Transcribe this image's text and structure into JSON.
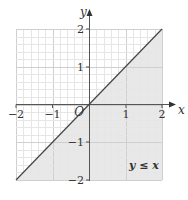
{
  "chart_data": {
    "type": "line",
    "title": "",
    "xlabel": "x",
    "ylabel": "y",
    "xlim": [
      -2,
      2
    ],
    "ylim": [
      -2,
      2
    ],
    "grid": true,
    "grid_minor_step": 0.2,
    "x_ticks": [
      -2,
      -1,
      1,
      2
    ],
    "y_ticks": [
      2,
      1,
      -1,
      -2
    ],
    "x_tick_labels": [
      "−2",
      "−1",
      "1",
      "2"
    ],
    "y_tick_labels": [
      "2",
      "1",
      "−1",
      "−2"
    ],
    "origin_label": "O",
    "series": [
      {
        "name": "y = x",
        "x": [
          -2,
          2
        ],
        "y": [
          -2,
          2
        ]
      }
    ],
    "shaded_region": {
      "inequality": "y ≤ x",
      "polygon": [
        [
          -2,
          -2
        ],
        [
          2,
          2
        ],
        [
          2,
          -2
        ]
      ],
      "color": "#e4e4e4"
    },
    "annotations": [
      {
        "text": "y ≤ x",
        "x": 1.35,
        "y": -1.6
      }
    ],
    "legend": null
  },
  "labels": {
    "x_axis": "x",
    "y_axis": "y",
    "origin": "O",
    "region": "y ≤ x",
    "xt_m2": "−2",
    "xt_m1": "−1",
    "xt_1": "1",
    "xt_2": "2",
    "yt_2": "2",
    "yt_1": "1",
    "yt_m1": "−1",
    "yt_m2": "−2"
  },
  "colors": {
    "shade": "#e4e4e4",
    "grid_minor": "#e6e6e6",
    "grid_major": "#cfcfcf",
    "axis": "#555555",
    "line": "#444444"
  }
}
